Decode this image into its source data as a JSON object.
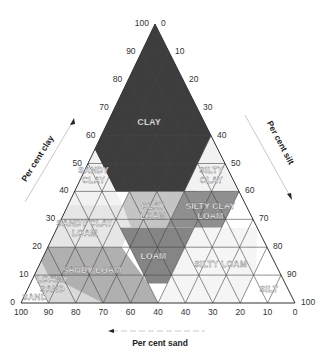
{
  "chart_data": {
    "type": "ternary",
    "title": "",
    "axes": {
      "clay": {
        "label": "Per cent clay",
        "ticks": [
          "0",
          "10",
          "20",
          "30",
          "40",
          "50",
          "60",
          "70",
          "80",
          "90",
          "100"
        ],
        "direction": "increasing-up"
      },
      "silt": {
        "label": "Per cent silt",
        "ticks": [
          "0",
          "10",
          "20",
          "30",
          "40",
          "50",
          "60",
          "70",
          "80",
          "90",
          "100"
        ],
        "direction": "increasing-down-right"
      },
      "sand": {
        "label": "Per cent sand",
        "ticks": [
          "100",
          "90",
          "80",
          "70",
          "60",
          "40",
          "40",
          "30",
          "20",
          "10",
          "0"
        ],
        "direction": "increasing-left"
      }
    },
    "grid_step": 10,
    "regions": [
      {
        "name": "Clay",
        "label_lines": [
          "CLAY"
        ],
        "shade": "#3d3d3d",
        "polygon": [
          [
            100,
            0
          ],
          [
            60,
            0
          ],
          [
            55,
            0
          ],
          [
            40,
            15
          ],
          [
            40,
            45
          ],
          [
            45,
            45
          ],
          [
            55,
            45
          ]
        ],
        "label_at": [
          65,
          15
        ]
      },
      {
        "name": "Sandy clay",
        "label_lines": [
          "SANDY",
          "CLAY"
        ],
        "shade": "#f2f2f2",
        "polygon": [
          [
            55,
            0
          ],
          [
            35,
            0
          ],
          [
            35,
            20
          ],
          [
            55,
            0
          ]
        ],
        "label_at": [
          46,
          4
        ]
      },
      {
        "name": "Silty clay",
        "label_lines": [
          "SILTY",
          "CLAY"
        ],
        "shade": "#f2f2f2",
        "polygon": [
          [
            60,
            40
          ],
          [
            40,
            40
          ],
          [
            40,
            60
          ]
        ],
        "label_at": [
          46,
          47
        ]
      },
      {
        "name": "Clay loam",
        "label_lines": [
          "CLAY",
          "LOAM"
        ],
        "shade": "#c4c4c4",
        "polygon": [
          [
            40,
            20
          ],
          [
            27,
            20
          ],
          [
            27,
            40
          ],
          [
            40,
            40
          ]
        ],
        "label_at": [
          33,
          32
        ]
      },
      {
        "name": "Silty clay loam",
        "label_lines": [
          "SILTY CLAY",
          "LOAM"
        ],
        "shade": "#8f8f8f",
        "polygon": [
          [
            40,
            40
          ],
          [
            27,
            40
          ],
          [
            27,
            60
          ],
          [
            40,
            60
          ]
        ],
        "label_at": [
          33,
          53
        ]
      },
      {
        "name": "Sandy clay loam",
        "label_lines": [
          "SANDY CLAY",
          "LOAM"
        ],
        "shade": "#e6e6e6",
        "polygon": [
          [
            35,
            0
          ],
          [
            20,
            0
          ],
          [
            20,
            27
          ],
          [
            27,
            27
          ],
          [
            35,
            20
          ]
        ],
        "label_at": [
          27,
          10
        ]
      },
      {
        "name": "Loam",
        "label_lines": [
          "LOAM"
        ],
        "shade": "#858585",
        "polygon": [
          [
            27,
            23
          ],
          [
            7,
            43
          ],
          [
            7,
            50
          ],
          [
            27,
            50
          ]
        ],
        "label_at": [
          17,
          40
        ]
      },
      {
        "name": "Silty loam",
        "label_lines": [
          "SILTY LOAM"
        ],
        "shade": "#f5f5f5",
        "polygon": [
          [
            27,
            50
          ],
          [
            0,
            50
          ],
          [
            0,
            80
          ],
          [
            12,
            80
          ],
          [
            27,
            73
          ]
        ],
        "label_at": [
          14,
          66
        ]
      },
      {
        "name": "Sandy loam",
        "label_lines": [
          "SANDY LOAM"
        ],
        "shade": "#b0b0b0",
        "polygon": [
          [
            20,
            0
          ],
          [
            7,
            0
          ],
          [
            0,
            0
          ],
          [
            0,
            50
          ],
          [
            7,
            43
          ],
          [
            20,
            27
          ]
        ],
        "label_at": [
          12,
          20
        ]
      },
      {
        "name": "Loamy sand",
        "label_lines": [
          "LOAMY",
          "SAND"
        ],
        "shade": "#d9d9d9",
        "polygon": [
          [
            15,
            0
          ],
          [
            0,
            0
          ],
          [
            0,
            30
          ],
          [
            10,
            5
          ]
        ],
        "label_at": [
          7,
          8
        ]
      },
      {
        "name": "Sand",
        "label_lines": [
          "SAND"
        ],
        "shade": "#ffffff",
        "polygon": [
          [
            10,
            0
          ],
          [
            0,
            0
          ],
          [
            0,
            10
          ]
        ],
        "label_at": [
          2,
          4
        ]
      },
      {
        "name": "Silt",
        "label_lines": [
          "SILT"
        ],
        "shade": "#ffffff",
        "polygon": [
          [
            12,
            80
          ],
          [
            0,
            80
          ],
          [
            0,
            100
          ],
          [
            12,
            88
          ]
        ],
        "label_at": [
          5,
          88
        ]
      }
    ]
  }
}
